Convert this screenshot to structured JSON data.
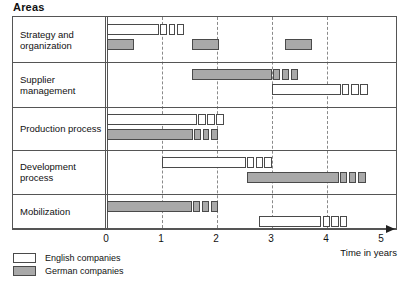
{
  "title": "Areas",
  "axis": {
    "caption": "Time in years",
    "ticks": [
      "0",
      "1",
      "2",
      "3",
      "4",
      "5"
    ],
    "min": 0,
    "max": 5
  },
  "legend": {
    "items": [
      {
        "label": "English companies",
        "key": "english",
        "color": "#ffffff"
      },
      {
        "label": "German companies",
        "key": "german",
        "color": "#a9a9a9"
      }
    ]
  },
  "rows": [
    {
      "label": "Strategy and\norganization"
    },
    {
      "label": "Supplier\nmanagement"
    },
    {
      "label": "Production process"
    },
    {
      "label": "Development\nprocess"
    },
    {
      "label": "Mobilization"
    }
  ],
  "chart_data": {
    "type": "bar",
    "chart_kind": "gantt",
    "title": "Areas",
    "xlabel": "Time in years",
    "ylabel": "Areas",
    "xlim": [
      0,
      5
    ],
    "grid": "vertical dashed gridlines at 1, 2, 3, 4; solid axis line at 0",
    "legend_position": "below-left",
    "categories": [
      "Strategy and organization",
      "Supplier management",
      "Production process",
      "Development process",
      "Mobilization"
    ],
    "series": [
      {
        "name": "English companies",
        "color": "#ffffff",
        "bars": [
          {
            "category": "Strategy and organization",
            "start": 0.0,
            "end": 0.95,
            "tail_boxes": 3,
            "tail_end": 1.42
          },
          {
            "category": "Supplier management",
            "start": 3.0,
            "end": 4.25,
            "tail_boxes": 3,
            "tail_end": 4.77
          },
          {
            "category": "Production process",
            "start": 0.0,
            "end": 1.64,
            "tail_boxes": 3,
            "tail_end": 2.15
          },
          {
            "category": "Development process",
            "start": 1.0,
            "end": 2.53,
            "tail_boxes": 3,
            "tail_end": 3.02
          },
          {
            "category": "Mobilization",
            "start": 2.77,
            "end": 3.9,
            "tail_boxes": 3,
            "tail_end": 4.4
          }
        ]
      },
      {
        "name": "German companies",
        "color": "#a9a9a9",
        "bars": [
          {
            "category": "Strategy and organization",
            "start": 0.0,
            "end": 0.49,
            "tail_boxes": 0,
            "tail_end": 0.49
          },
          {
            "category": "Strategy and organization",
            "start": 1.55,
            "end": 2.04,
            "tail_boxes": 0,
            "tail_end": 2.04
          },
          {
            "category": "Strategy and organization",
            "start": 3.23,
            "end": 3.72,
            "tail_boxes": 0,
            "tail_end": 3.72
          },
          {
            "category": "Supplier management",
            "start": 1.55,
            "end": 3.0,
            "tail_boxes": 3,
            "tail_end": 3.5
          },
          {
            "category": "Production process",
            "start": 0.0,
            "end": 1.57,
            "tail_boxes": 3,
            "tail_end": 2.04
          },
          {
            "category": "Development process",
            "start": 2.55,
            "end": 4.21,
            "tail_boxes": 3,
            "tail_end": 4.73
          },
          {
            "category": "Mobilization",
            "start": 0.0,
            "end": 1.55,
            "tail_boxes": 3,
            "tail_end": 2.04
          }
        ]
      }
    ]
  }
}
